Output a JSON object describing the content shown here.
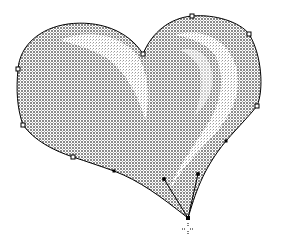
{
  "canvas": {
    "width": 282,
    "height": 249,
    "background": "#ffffff"
  },
  "shape": {
    "name": "heart",
    "fill_pattern": "dithered-gray",
    "fill_color": "#9a9a9a",
    "highlight_color": "#ffffff",
    "stroke_color": "#000000",
    "path": "M143,54 C128,30 98,20 68,24 C40,28 20,45 18,69 C16,90 17,108 23,125 C34,140 52,150 73,157 C88,162 100,166 114,171 C140,181 160,196 188,218 C195,195 202,170 226,141 C240,125 250,115 257,106 C264,90 262,55 249,34 C240,22 215,14 192,16 C170,18 152,32 143,54 Z"
  },
  "anchors": [
    {
      "id": "top-cleft",
      "x": 143,
      "y": 54,
      "selected": false
    },
    {
      "id": "right-lobe-top",
      "x": 192,
      "y": 16,
      "selected": false
    },
    {
      "id": "right-lobe-upper",
      "x": 249,
      "y": 34,
      "selected": false
    },
    {
      "id": "right-lobe-side",
      "x": 257,
      "y": 106,
      "selected": false
    },
    {
      "id": "right-lower",
      "x": 226,
      "y": 141,
      "selected": true
    },
    {
      "id": "bottom-tip",
      "x": 188,
      "y": 218,
      "selected": true
    },
    {
      "id": "left-lower",
      "x": 114,
      "y": 171,
      "selected": true
    },
    {
      "id": "left-bottom",
      "x": 73,
      "y": 157,
      "selected": false
    },
    {
      "id": "left-side-lower",
      "x": 23,
      "y": 125,
      "selected": false
    },
    {
      "id": "left-side-upper",
      "x": 18,
      "y": 69,
      "selected": false
    }
  ],
  "handles": [
    {
      "from": "bottom-tip",
      "x": 164,
      "y": 179
    },
    {
      "from": "bottom-tip",
      "x": 198,
      "y": 174
    }
  ],
  "cursor": {
    "type": "crosshair",
    "x": 188,
    "y": 229
  }
}
